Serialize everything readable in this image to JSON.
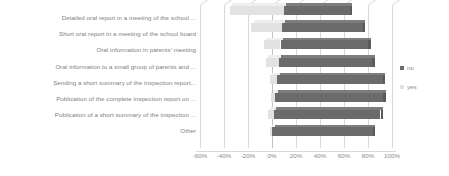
{
  "chart_data": {
    "type": "bar",
    "title": "",
    "subtitle": "",
    "orientation": "horizontal",
    "stacked": true,
    "xlabel": "",
    "ylabel": "",
    "xlim": [
      -60,
      100
    ],
    "xticks": [
      -60,
      -40,
      -20,
      0,
      20,
      40,
      60,
      80,
      100
    ],
    "xtick_labels": [
      "-60%",
      "-40%",
      "-20%",
      "0%",
      "20%",
      "40%",
      "60%",
      "80%",
      "100%"
    ],
    "grid": true,
    "legend_position": "right",
    "categories": [
      "Detailed oral report in a meeting of the school ...",
      "Short oral report in a meeting of the school board",
      "Oral information in parents' meeting",
      "Oral information to a small group of parents and ...",
      "Sending a short summary of the inspection report...",
      "Publication of the complete inspection report on ...",
      "Publication of a short summary of the inspection ...",
      "Other"
    ],
    "series": [
      {
        "name": "no",
        "color": "#6b6b6b",
        "values": [
          55,
          67,
          73,
          78,
          88,
          90,
          89,
          84
        ]
      },
      {
        "name": "yes",
        "color": "#e2e2e2",
        "values": [
          -45,
          -26,
          -14,
          -11,
          -6,
          -4,
          -5,
          -2
        ]
      }
    ]
  },
  "legend": {
    "items": [
      {
        "label": "no",
        "color": "#6b6b6b"
      },
      {
        "label": "yes",
        "color": "#e2e2e2"
      }
    ]
  }
}
